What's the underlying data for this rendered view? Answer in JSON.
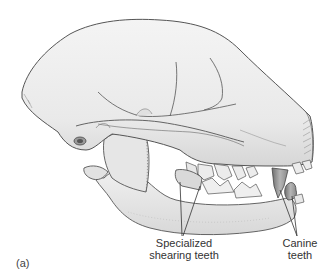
{
  "figure": {
    "panel_label": "(a)",
    "labels": {
      "shearing_teeth": {
        "line1": "Specialized",
        "line2": "shearing teeth"
      },
      "canine_teeth": {
        "line1": "Canine",
        "line2": "teeth"
      }
    },
    "colors": {
      "bone_fill": "#ededed",
      "bone_shadow": "#cfcfcf",
      "outline": "#555555",
      "tooth_dark": "#8a8a8a",
      "leader_line": "#333333",
      "background": "#ffffff"
    }
  }
}
